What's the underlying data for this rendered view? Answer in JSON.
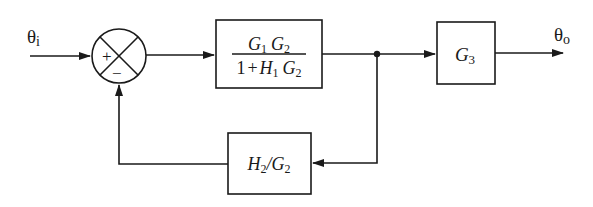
{
  "signals": {
    "input": {
      "symbol": "θ",
      "subscript": "i"
    },
    "output": {
      "symbol": "θ",
      "subscript": "o"
    }
  },
  "summing_junction": {
    "plus_sign": "+",
    "minus_sign": "−"
  },
  "blocks": {
    "forward1": {
      "numerator": {
        "a": "G",
        "a_sub": "1",
        "b": "G",
        "b_sub": "2"
      },
      "denominator": {
        "one": "1",
        "plus": "+",
        "a": "H",
        "a_sub": "1",
        "b": "G",
        "b_sub": "2"
      }
    },
    "forward2": {
      "name": "G",
      "sub": "3"
    },
    "feedback": {
      "a": "H",
      "a_sub": "2",
      "slash": "/",
      "b": "G",
      "b_sub": "2"
    }
  },
  "colors": {
    "stroke": "#1a1a1a",
    "background": "#ffffff"
  }
}
